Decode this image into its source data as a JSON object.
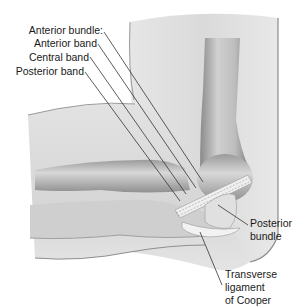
{
  "figure": {
    "labels": {
      "anterior_bundle": "Anterior bundle:",
      "anterior_band": "Anterior band",
      "central_band": "Central band",
      "posterior_band": "Posterior band",
      "posterior_bundle_line1": "Posterior",
      "posterior_bundle_line2": "bundle",
      "transverse_line1": "Transverse",
      "transverse_line2": "ligament",
      "transverse_line3": "of Cooper"
    }
  }
}
